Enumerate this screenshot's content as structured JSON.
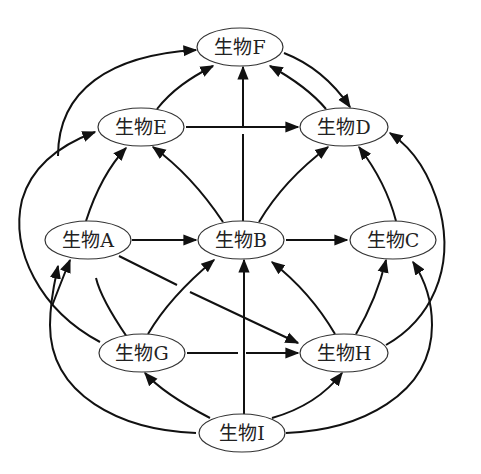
{
  "diagram": {
    "type": "food-web",
    "node_prefix": "生物",
    "nodes": [
      {
        "id": "F",
        "label": "生物F",
        "cx": 240,
        "cy": 47
      },
      {
        "id": "E",
        "label": "生物E",
        "cx": 141,
        "cy": 127
      },
      {
        "id": "D",
        "label": "生物D",
        "cx": 344,
        "cy": 127
      },
      {
        "id": "A",
        "label": "生物A",
        "cx": 88,
        "cy": 240
      },
      {
        "id": "B",
        "label": "生物B",
        "cx": 241,
        "cy": 240
      },
      {
        "id": "C",
        "label": "生物C",
        "cx": 393,
        "cy": 240
      },
      {
        "id": "G",
        "label": "生物G",
        "cx": 142,
        "cy": 353
      },
      {
        "id": "H",
        "label": "生物H",
        "cx": 344,
        "cy": 353
      },
      {
        "id": "I",
        "label": "生物I",
        "cx": 242,
        "cy": 433
      }
    ],
    "edges": [
      {
        "from": "A",
        "to": "F"
      },
      {
        "from": "A",
        "to": "E"
      },
      {
        "from": "A",
        "to": "B"
      },
      {
        "from": "A",
        "to": "H"
      },
      {
        "from": "E",
        "to": "F"
      },
      {
        "from": "E",
        "to": "D"
      },
      {
        "from": "F",
        "to": "D"
      },
      {
        "from": "D",
        "to": "F"
      },
      {
        "from": "B",
        "to": "F"
      },
      {
        "from": "B",
        "to": "E"
      },
      {
        "from": "B",
        "to": "D"
      },
      {
        "from": "B",
        "to": "C"
      },
      {
        "from": "C",
        "to": "D"
      },
      {
        "from": "G",
        "to": "E"
      },
      {
        "from": "G",
        "to": "A"
      },
      {
        "from": "G",
        "to": "B"
      },
      {
        "from": "G",
        "to": "H"
      },
      {
        "from": "H",
        "to": "B"
      },
      {
        "from": "H",
        "to": "C"
      },
      {
        "from": "H",
        "to": "D"
      },
      {
        "from": "I",
        "to": "A"
      },
      {
        "from": "I",
        "to": "G"
      },
      {
        "from": "I",
        "to": "B"
      },
      {
        "from": "I",
        "to": "H"
      },
      {
        "from": "I",
        "to": "C"
      }
    ]
  },
  "labels": {
    "F": "生物F",
    "E": "生物E",
    "D": "生物D",
    "A": "生物A",
    "B": "生物B",
    "C": "生物C",
    "G": "生物G",
    "H": "生物H",
    "I": "生物I"
  },
  "colors": {
    "line": "#111111",
    "node_stroke": "#333333",
    "node_fill": "#ffffff",
    "background": "#ffffff"
  }
}
